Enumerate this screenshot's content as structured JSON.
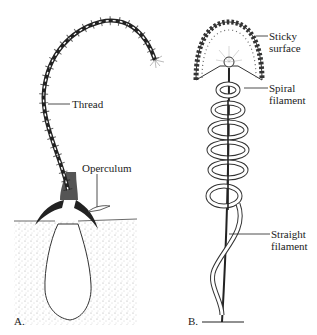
{
  "panel_a": {
    "panel_label": "A.",
    "labels": {
      "thread": "Thread",
      "operculum": "Operculum"
    }
  },
  "panel_b": {
    "panel_label": "B.",
    "labels": {
      "sticky_line1": "Sticky",
      "sticky_line2": "surface",
      "spiral_line1": "Spiral",
      "spiral_line2": "filament",
      "straight_line1": "Straight",
      "straight_line2": "filament"
    }
  },
  "colors": {
    "ink": "#222222",
    "background": "#ffffff",
    "sand": "#cfcfcf"
  }
}
